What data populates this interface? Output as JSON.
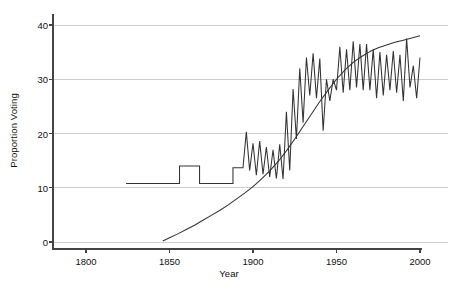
{
  "chart_data": {
    "type": "line",
    "title": "",
    "xlabel": "Year",
    "ylabel": "Proportion Voting",
    "xlim": [
      1770,
      2005
    ],
    "ylim": [
      -1.5,
      41.5
    ],
    "xticks": [
      1800,
      1850,
      1900,
      1950,
      2000
    ],
    "xticklabels": [
      "1800",
      "1850",
      "1900",
      "1950",
      "2000"
    ],
    "yticks": [
      0,
      10,
      20,
      30,
      40
    ],
    "yticklabels": [
      "0",
      "10",
      "20",
      "30",
      "40"
    ],
    "grid": "horizontal",
    "grid_color": "#cccccc",
    "legend": "none",
    "line_color": "#333333",
    "background": "#ffffff",
    "series": [
      {
        "name": "Proportion Voting (turnout)",
        "style": "step-then-zigzag",
        "x": [
          1824,
          1826,
          1828,
          1830,
          1832,
          1834,
          1836,
          1838,
          1840,
          1842,
          1844,
          1846,
          1848,
          1850,
          1852,
          1854,
          1856,
          1858,
          1860,
          1862,
          1864,
          1866,
          1868,
          1870,
          1872,
          1874,
          1876,
          1878,
          1880,
          1882,
          1884,
          1886,
          1888,
          1890,
          1892,
          1894,
          1896,
          1898,
          1900,
          1902,
          1904,
          1906,
          1908,
          1910,
          1912,
          1914,
          1916,
          1918,
          1920,
          1922,
          1924,
          1926,
          1928,
          1930,
          1932,
          1934,
          1936,
          1938,
          1940,
          1942,
          1944,
          1946,
          1948,
          1950,
          1952,
          1954,
          1956,
          1958,
          1960,
          1962,
          1964,
          1966,
          1968,
          1970,
          1972,
          1974,
          1976,
          1978,
          1980,
          1982,
          1984,
          1986,
          1988,
          1990,
          1992,
          1994,
          1996,
          1998,
          2000
        ],
        "values": [
          10.8,
          10.8,
          10.8,
          10.8,
          10.8,
          10.8,
          10.8,
          10.8,
          10.8,
          10.8,
          10.8,
          10.8,
          10.8,
          10.8,
          10.8,
          10.8,
          14.0,
          14.0,
          14.0,
          14.0,
          14.0,
          14.0,
          10.8,
          10.8,
          10.8,
          10.8,
          10.8,
          10.8,
          10.8,
          10.8,
          10.8,
          10.8,
          13.7,
          13.7,
          13.7,
          13.7,
          20.3,
          13.2,
          18.2,
          12.3,
          18.6,
          12.5,
          17.5,
          12.0,
          17.0,
          11.7,
          18.0,
          11.6,
          24.0,
          13.2,
          28.2,
          19.0,
          32.0,
          22.0,
          34.0,
          27.0,
          34.8,
          26.5,
          33.8,
          20.5,
          30.0,
          26.0,
          30.0,
          28.0,
          36.0,
          27.5,
          35.5,
          28.0,
          37.0,
          28.5,
          36.5,
          28.0,
          36.5,
          28.0,
          35.5,
          26.5,
          35.0,
          27.0,
          34.5,
          28.0,
          35.2,
          27.5,
          34.5,
          26.0,
          37.5,
          28.5,
          32.5,
          26.5,
          34.0
        ]
      },
      {
        "name": "Eligible Electorate (smooth)",
        "style": "smooth",
        "x": [
          1846,
          1850,
          1855,
          1860,
          1865,
          1870,
          1875,
          1880,
          1885,
          1890,
          1895,
          1900,
          1905,
          1910,
          1915,
          1920,
          1925,
          1930,
          1935,
          1940,
          1945,
          1950,
          1955,
          1960,
          1965,
          1970,
          1975,
          1980,
          1985,
          1990,
          1995,
          2000
        ],
        "values": [
          0.2,
          0.8,
          1.5,
          2.3,
          3.1,
          4.0,
          4.9,
          5.8,
          6.8,
          7.9,
          9.0,
          10.2,
          11.6,
          13.1,
          14.8,
          16.8,
          19.0,
          21.3,
          23.6,
          25.9,
          28.0,
          30.0,
          31.7,
          33.1,
          34.2,
          35.1,
          35.8,
          36.3,
          36.8,
          37.2,
          37.6,
          38.0
        ]
      }
    ]
  },
  "axes": {
    "ylabel_text": "Proportion Voting",
    "xlabel_text": "Year"
  }
}
